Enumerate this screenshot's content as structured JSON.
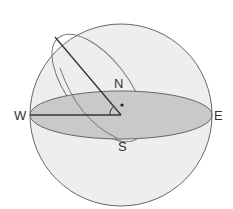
{
  "diagram": {
    "labels": {
      "north": "N",
      "south": "S",
      "east": "E",
      "west": "W"
    },
    "colors": {
      "sphere_fill": "#eeeeee",
      "horizon_fill": "#c9c9c9",
      "stroke": "#555555",
      "line": "#333333",
      "background": "#ffffff"
    }
  }
}
